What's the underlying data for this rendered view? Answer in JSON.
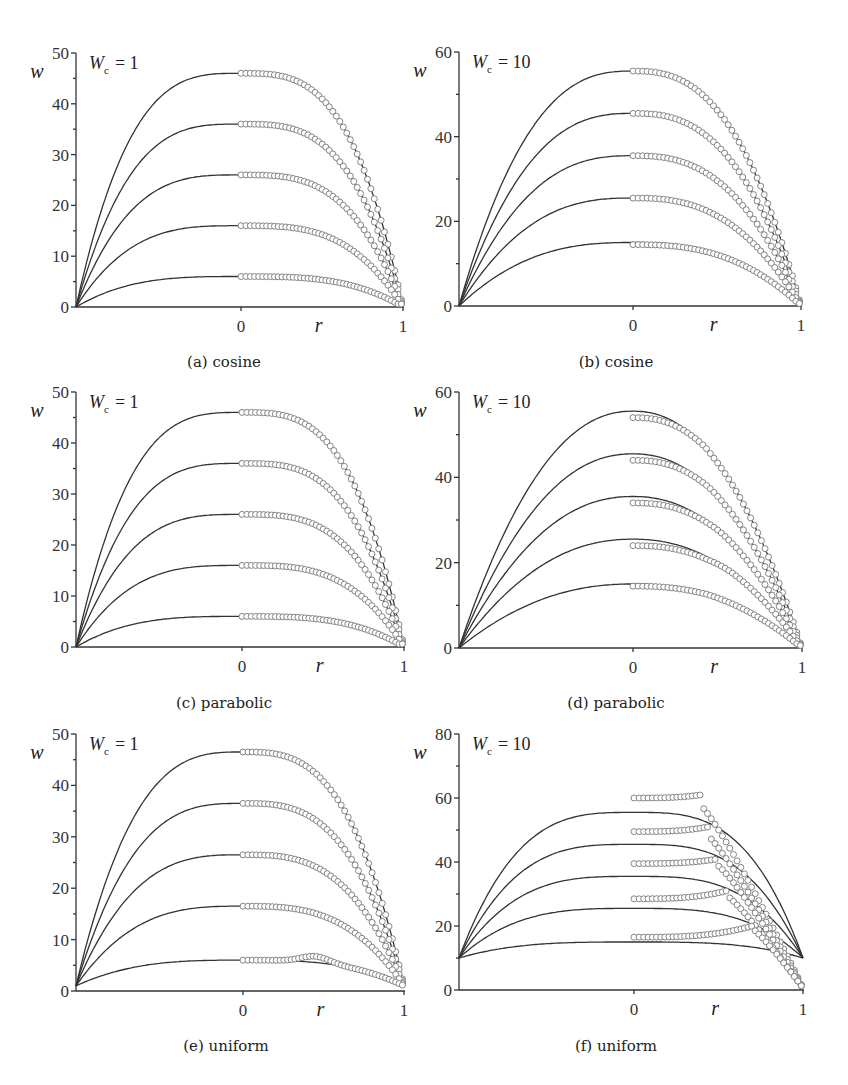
{
  "figure": {
    "y_axis_var": "w",
    "x_axis_var": "r",
    "x_tick_labels": [
      "0",
      "1"
    ]
  },
  "chart_data": [
    {
      "id": "a",
      "type": "line",
      "caption": "(a) cosine",
      "profile": "cosine",
      "param_label": {
        "symbol": "W",
        "sub": "c",
        "value": "= 1"
      },
      "xlabel": "r",
      "ylabel": "w",
      "xlim": [
        -1,
        1
      ],
      "ylim": [
        0,
        50
      ],
      "yticks": [
        0,
        10,
        20,
        30,
        40,
        50
      ],
      "minor_ytick_step": 5,
      "xticks": [
        0,
        1
      ],
      "line_start_value": 0,
      "line_end_value": 0,
      "series_lines_plateau": [
        46,
        36,
        26,
        16,
        6
      ],
      "series_markers_center": [
        46,
        36,
        26,
        16,
        6
      ],
      "marker_style": "open-circle",
      "line_style": "solid"
    },
    {
      "id": "b",
      "type": "line",
      "caption": "(b) cosine",
      "profile": "cosine",
      "param_label": {
        "symbol": "W",
        "sub": "c",
        "value": "= 10"
      },
      "xlabel": "r",
      "ylabel": "w",
      "xlim": [
        -1,
        1
      ],
      "ylim": [
        0,
        60
      ],
      "yticks": [
        0,
        20,
        40,
        60
      ],
      "minor_ytick_step": 10,
      "xticks": [
        0,
        1
      ],
      "line_start_value": 0,
      "line_end_value": 0,
      "series_lines_plateau": [
        55.5,
        45.5,
        35.5,
        25.5,
        15
      ],
      "series_markers_center": [
        55.5,
        45.5,
        35.5,
        25.5,
        14.5
      ],
      "marker_style": "open-circle",
      "line_style": "solid"
    },
    {
      "id": "c",
      "type": "line",
      "caption": "(c) parabolic",
      "profile": "parabolic",
      "param_label": {
        "symbol": "W",
        "sub": "c",
        "value": "= 1"
      },
      "xlabel": "r",
      "ylabel": "w",
      "xlim": [
        -1,
        1
      ],
      "ylim": [
        0,
        50
      ],
      "yticks": [
        0,
        10,
        20,
        30,
        40,
        50
      ],
      "minor_ytick_step": 5,
      "xticks": [
        0,
        1
      ],
      "line_start_value": 0,
      "line_end_value": 0,
      "series_lines_plateau": [
        46,
        36,
        26,
        16,
        6
      ],
      "series_markers_center": [
        46,
        36,
        26,
        16,
        6
      ],
      "marker_style": "open-circle",
      "line_style": "solid"
    },
    {
      "id": "d",
      "type": "line",
      "caption": "(d) parabolic",
      "profile": "parabolic",
      "param_label": {
        "symbol": "W",
        "sub": "c",
        "value": "= 10"
      },
      "xlabel": "r",
      "ylabel": "w",
      "xlim": [
        -1,
        1
      ],
      "ylim": [
        0,
        60
      ],
      "yticks": [
        0,
        20,
        40,
        60
      ],
      "minor_ytick_step": 10,
      "xticks": [
        0,
        1
      ],
      "line_start_value": 0,
      "line_end_value": 0,
      "series_lines_plateau": [
        55.5,
        45.5,
        35.5,
        25.5,
        15
      ],
      "series_markers_center": [
        53.5,
        43.5,
        33.5,
        23.5,
        14
      ],
      "marker_style": "open-circle",
      "line_style": "solid"
    },
    {
      "id": "e",
      "type": "line",
      "caption": "(e) uniform",
      "profile": "uniform",
      "param_label": {
        "symbol": "W",
        "sub": "c",
        "value": "= 1"
      },
      "xlabel": "r",
      "ylabel": "w",
      "xlim": [
        -1,
        1
      ],
      "ylim": [
        0,
        50
      ],
      "yticks": [
        0,
        10,
        20,
        30,
        40,
        50
      ],
      "minor_ytick_step": 5,
      "xticks": [
        0,
        1
      ],
      "line_start_value": 1,
      "line_end_value": 1,
      "series_lines_plateau": [
        46.5,
        36.5,
        26.5,
        16.5,
        6
      ],
      "series_markers_center": [
        46.5,
        36.5,
        26.5,
        16.5,
        6
      ],
      "marker_style": "open-circle",
      "line_style": "solid"
    },
    {
      "id": "f",
      "type": "line",
      "caption": "(f) uniform",
      "profile": "uniform",
      "param_label": {
        "symbol": "W",
        "sub": "c",
        "value": "= 10"
      },
      "xlabel": "r",
      "ylabel": "w",
      "xlim": [
        -1,
        1
      ],
      "ylim": [
        0,
        80
      ],
      "yticks": [
        0,
        20,
        40,
        60,
        80
      ],
      "minor_ytick_step": 10,
      "xticks": [
        0,
        1
      ],
      "line_start_value": 10,
      "line_end_value": 10,
      "series_lines_plateau": [
        55.5,
        45.5,
        35.5,
        25.5,
        15
      ],
      "series_markers_center": [
        60,
        49.5,
        39.5,
        28.5,
        16.5
      ],
      "series_markers_peak": [
        61,
        51,
        41,
        31,
        20
      ],
      "series_markers_kink_r": [
        0.4,
        0.44,
        0.5,
        0.55,
        0.7
      ],
      "marker_style": "open-circle",
      "line_style": "solid"
    }
  ]
}
